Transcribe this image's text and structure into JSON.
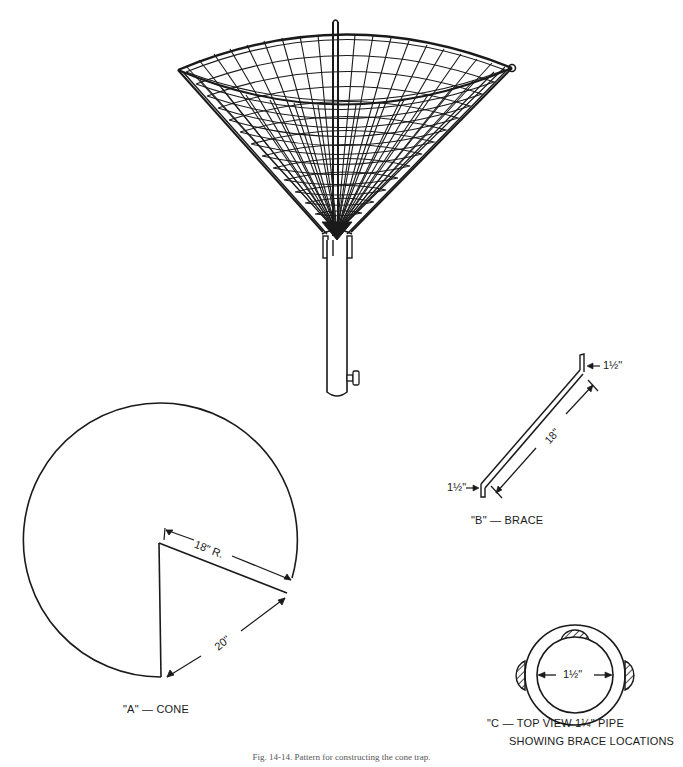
{
  "figure": {
    "caption": "Fig. 14-14. Pattern for constructing the cone trap."
  },
  "cone_trap_drawing": {
    "name": "Wire mesh cone trap on pipe rod"
  },
  "part_a": {
    "label": "\"A\" — CONE",
    "radius_label": "18\" R.",
    "chord_label": "20\""
  },
  "part_b": {
    "label": "\"B\" — BRACE",
    "length_label": "18\"",
    "top_tab_label": "1½\"",
    "bottom_tab_label": "1½\""
  },
  "part_c": {
    "label_line1": "\"C — TOP VIEW 1¼\" PIPE",
    "label_line2": "SHOWING BRACE LOCATIONS",
    "inner_diameter_label": "1½\""
  },
  "colors": {
    "ink": "#1a1a1a",
    "paper": "#ffffff"
  }
}
